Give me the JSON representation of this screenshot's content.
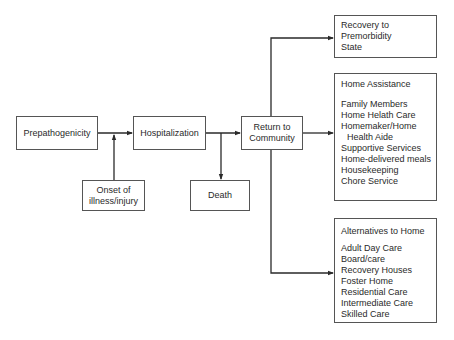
{
  "diagram": {
    "nodes": {
      "prepathogenicity": {
        "label": "Prepathogenicity"
      },
      "onset": {
        "line1": "Onset of",
        "line2": "illness/injury"
      },
      "hospitalization": {
        "label": "Hospitalization"
      },
      "death": {
        "label": "Death"
      },
      "return_to_community": {
        "line1": "Return to",
        "line2": "Community"
      },
      "recovery": {
        "line1": "Recovery to",
        "line2": "Premorbidity",
        "line3": "State"
      },
      "home_assistance": {
        "title": "Home Assistance",
        "items": [
          "Family Members",
          "Home Helath Care",
          "Homemaker/Home",
          "Health Aide",
          "Supportive Services",
          "Home-delivered meals",
          "Housekeeping",
          "Chore Service"
        ]
      },
      "alternatives": {
        "title": "Alternatives to Home",
        "items": [
          "Adult Day Care",
          "Board/care",
          "Recovery Houses",
          "Foster Home",
          "Residential Care",
          "Intermediate Care",
          "Skilled Care"
        ]
      }
    },
    "edges": [
      {
        "from": "Prepathogenicity",
        "to": "Hospitalization"
      },
      {
        "from": "Onset of illness/injury",
        "to": "Prepathogenicity-Hospitalization link"
      },
      {
        "from": "Hospitalization",
        "to": "Return to Community"
      },
      {
        "from": "Hospitalization",
        "to": "Death"
      },
      {
        "from": "Return to Community",
        "to": "Recovery to Premorbidity State"
      },
      {
        "from": "Return to Community",
        "to": "Home Assistance"
      },
      {
        "from": "Return to Community",
        "to": "Alternatives to Home"
      }
    ],
    "colors": {
      "line": "#2a2a2a",
      "border": "#555555",
      "background": "#ffffff"
    }
  }
}
